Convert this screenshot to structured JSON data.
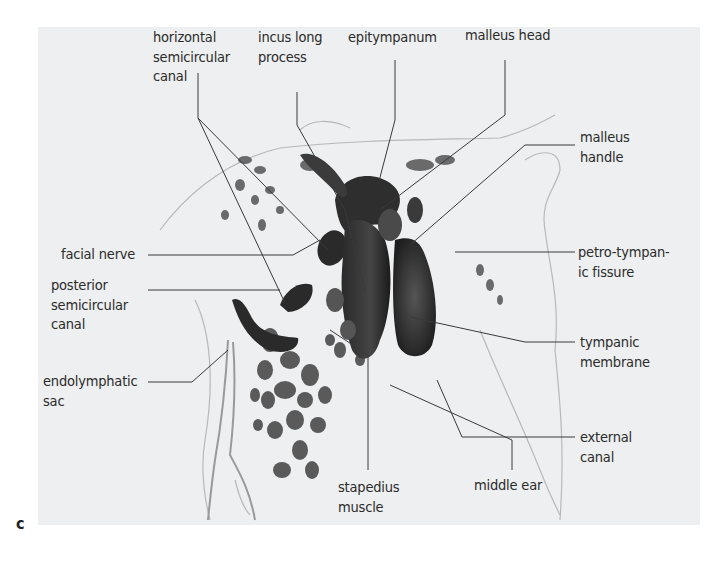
{
  "figure": {
    "panel_letter": "c",
    "background_color": "#eeeff0",
    "ink_color": "#2b2b2b",
    "labels": {
      "horizontal_semicircular_canal": "horizontal\nsemicircular\ncanal",
      "incus_long_process": "incus long\nprocess",
      "epitympanum": "epitympanum",
      "malleus_head": "malleus head",
      "malleus_handle": "malleus\nhandle",
      "petro_tympanic_fissure": "petro-tympan-\nic fissure",
      "tympanic_membrane": "tympanic\nmembrane",
      "external_canal": "external\ncanal",
      "middle_ear": "middle ear",
      "stapedius_muscle": "stapedius\nmuscle",
      "endolymphatic_sac": "endolymphatic\nsac",
      "posterior_semicircular_canal": "posterior\nsemicircular\ncanal",
      "facial_nerve": "facial nerve"
    }
  }
}
